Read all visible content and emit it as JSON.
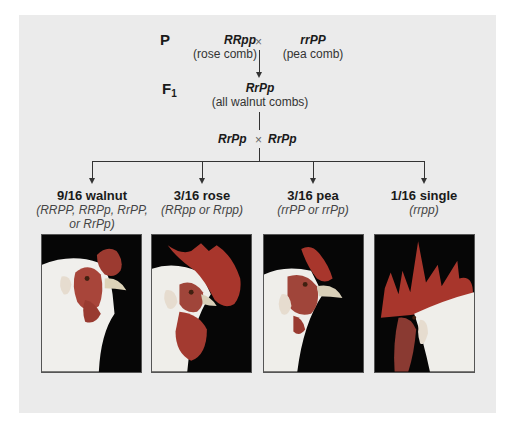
{
  "diagram": {
    "colors": {
      "panel_bg": "#ebebeb",
      "line": "#333333",
      "comb_red": "#b33a2e",
      "photo_bg": "#060606",
      "feather_white": "#f2f2f0"
    },
    "parental": {
      "label": "P",
      "left": {
        "genotype": "RRpp",
        "phenotype": "(rose comb)"
      },
      "cross_symbol": "×",
      "right": {
        "genotype": "rrPP",
        "phenotype": "(pea comb)"
      }
    },
    "f1": {
      "label": "F",
      "label_sub": "1",
      "genotype": "RrPp",
      "phenotype": "(all walnut combs)"
    },
    "f1_cross": {
      "left": "RrPp",
      "cross_symbol": "×",
      "right": "RrPp"
    },
    "results": [
      {
        "ratio": "9/16 walnut",
        "genotypes_line1": "(RRPP, RRPp, RrPP,",
        "genotypes_line2": "or RrPp)",
        "photo": "walnut-comb-chicken-photo"
      },
      {
        "ratio": "3/16 rose",
        "genotypes_line1": "(RRpp or Rrpp)",
        "genotypes_line2": "",
        "photo": "rose-comb-chicken-photo"
      },
      {
        "ratio": "3/16 pea",
        "genotypes_line1": "(rrPP or rrPp)",
        "genotypes_line2": "",
        "photo": "pea-comb-chicken-photo"
      },
      {
        "ratio": "1/16 single",
        "genotypes_line1": "(rrpp)",
        "genotypes_line2": "",
        "photo": "single-comb-chicken-photo"
      }
    ]
  }
}
